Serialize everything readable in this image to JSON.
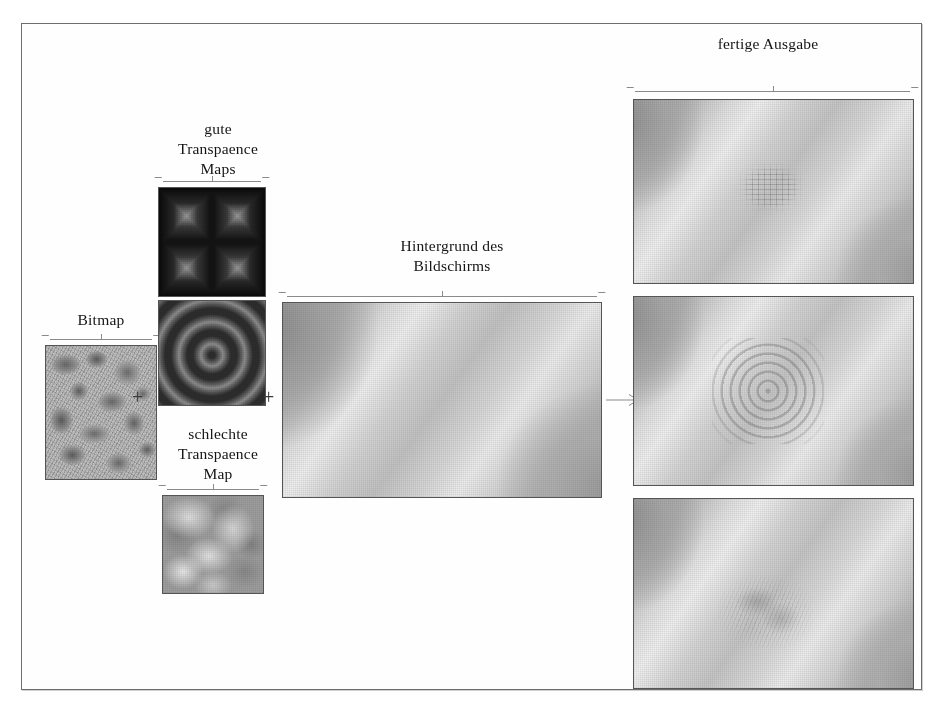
{
  "figure": {
    "language": "de",
    "frame_color": "#6d6d6d",
    "text_color": "#141414",
    "columns": {
      "bitmap": {
        "label": "Bitmap",
        "image_name": "bitmap-texture"
      },
      "good_maps": {
        "label": "gute\nTranspaence\nMaps",
        "images": [
          {
            "image_name": "square-ring-transparence-map"
          },
          {
            "image_name": "concentric-ring-transparence-map"
          }
        ]
      },
      "bad_map": {
        "label": "schlechte\nTranspaence\nMap",
        "image_name": "cloudy-transparence-map"
      },
      "backdrop": {
        "label": "Hintergrund des\nBildschirms",
        "image_name": "screen-backdrop"
      },
      "output": {
        "label": "fertige Ausgabe",
        "images": [
          {
            "image_name": "result-square-artefact"
          },
          {
            "image_name": "result-ring-artefact"
          },
          {
            "image_name": "result-cloud-artefact"
          }
        ]
      }
    },
    "operators": {
      "plus_bitmap_maps": "+",
      "plus_maps_backdrop": "+",
      "arrow_to_output": "→"
    }
  }
}
